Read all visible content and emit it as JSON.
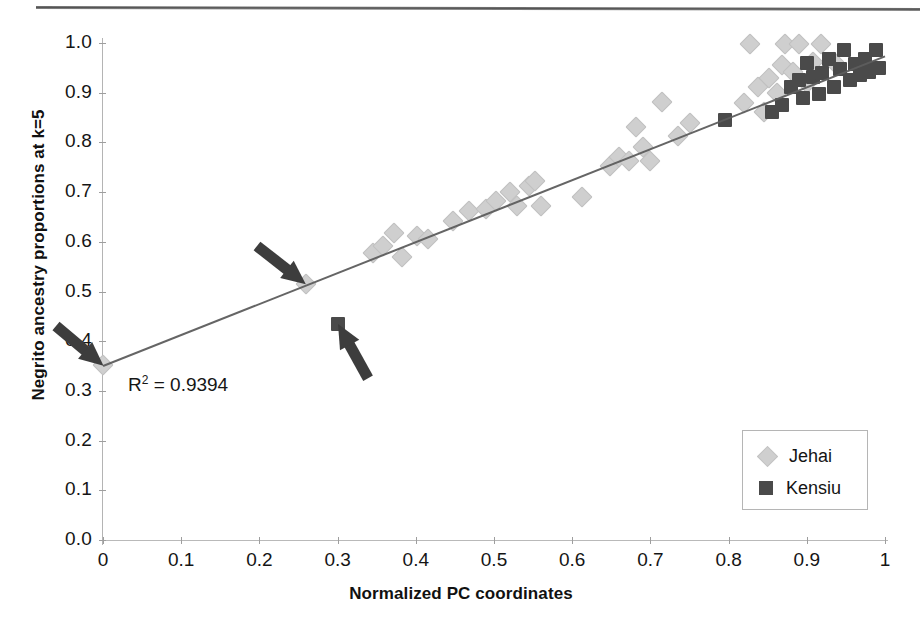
{
  "figure": {
    "annotation_r2_prefix": "R",
    "annotation_r2_sup": "2",
    "annotation_r2_value": " = 0.9394",
    "r2_full": "R2 = 0.9394"
  },
  "legend": {
    "position": "bottom-right",
    "items": [
      {
        "label": "Jehai",
        "marker": "diamond",
        "color": "#cfcfcf"
      },
      {
        "label": "Kensiu",
        "marker": "square",
        "color": "#4a4a4a"
      }
    ]
  },
  "axes": {
    "x_title": "Normalized PC coordinates",
    "y_title": "Negrito ancestry proportions at k=5",
    "x_ticks": [
      "0",
      "0.1",
      "0.2",
      "0.3",
      "0.4",
      "0.5",
      "0.6",
      "0.7",
      "0.8",
      "0.9",
      "1"
    ],
    "y_ticks": [
      "0.0",
      "0.1",
      "0.2",
      "0.3",
      "0.4",
      "0.5",
      "0.6",
      "0.7",
      "0.8",
      "0.9",
      "1.0"
    ]
  },
  "annotations": [
    {
      "name": "arrow-to-origin-point",
      "target_x": 0.0,
      "target_y": 0.35,
      "angle_deg": 40
    },
    {
      "name": "arrow-to-jehai-outlier",
      "target_x": 0.26,
      "target_y": 0.515,
      "angle_deg": 38
    },
    {
      "name": "arrow-to-kensiu-outlier",
      "target_x": 0.3,
      "target_y": 0.435,
      "angle_deg": -119
    }
  ],
  "chart_data": {
    "type": "scatter",
    "title": "",
    "xlabel": "Normalized PC coordinates",
    "ylabel": "Negrito ancestry proportions at k=5",
    "xlim": [
      0,
      1
    ],
    "ylim": [
      0,
      1
    ],
    "xticks": [
      0,
      0.1,
      0.2,
      0.3,
      0.4,
      0.5,
      0.6,
      0.7,
      0.8,
      0.9,
      1
    ],
    "yticks": [
      0.0,
      0.1,
      0.2,
      0.3,
      0.4,
      0.5,
      0.6,
      0.7,
      0.8,
      0.9,
      1.0
    ],
    "grid": false,
    "legend_position": "lower right",
    "annotations": [
      {
        "text": "R2 = 0.9394",
        "x": 0.04,
        "y": 0.335
      }
    ],
    "trendline": {
      "type": "linear",
      "r_squared": 0.9394,
      "x_from": 0.0,
      "y_from": 0.352,
      "x_to": 1.0,
      "y_to": 0.975
    },
    "series": [
      {
        "name": "Jehai",
        "marker": "diamond",
        "color": "#cfcfcf",
        "points": [
          [
            0.0,
            0.352
          ],
          [
            0.26,
            0.515
          ],
          [
            0.345,
            0.578
          ],
          [
            0.358,
            0.592
          ],
          [
            0.372,
            0.618
          ],
          [
            0.382,
            0.57
          ],
          [
            0.402,
            0.612
          ],
          [
            0.415,
            0.605
          ],
          [
            0.447,
            0.642
          ],
          [
            0.468,
            0.662
          ],
          [
            0.49,
            0.665
          ],
          [
            0.502,
            0.683
          ],
          [
            0.52,
            0.7
          ],
          [
            0.53,
            0.672
          ],
          [
            0.545,
            0.712
          ],
          [
            0.552,
            0.722
          ],
          [
            0.56,
            0.672
          ],
          [
            0.612,
            0.69
          ],
          [
            0.648,
            0.752
          ],
          [
            0.66,
            0.77
          ],
          [
            0.672,
            0.762
          ],
          [
            0.682,
            0.83
          ],
          [
            0.69,
            0.79
          ],
          [
            0.7,
            0.762
          ],
          [
            0.715,
            0.882
          ],
          [
            0.735,
            0.812
          ],
          [
            0.75,
            0.84
          ],
          [
            0.82,
            0.88
          ],
          [
            0.828,
            0.998
          ],
          [
            0.838,
            0.912
          ],
          [
            0.845,
            0.862
          ],
          [
            0.852,
            0.93
          ],
          [
            0.862,
            0.9
          ],
          [
            0.868,
            0.955
          ],
          [
            0.872,
            0.998
          ],
          [
            0.882,
            0.942
          ],
          [
            0.89,
            0.998
          ],
          [
            0.9,
            0.92
          ],
          [
            0.908,
            0.962
          ],
          [
            0.918,
            0.998
          ],
          [
            0.935,
            0.962
          ]
        ]
      },
      {
        "name": "Kensiu",
        "marker": "square",
        "color": "#4a4a4a",
        "points": [
          [
            0.3,
            0.435
          ],
          [
            0.795,
            0.845
          ],
          [
            0.855,
            0.862
          ],
          [
            0.868,
            0.875
          ],
          [
            0.88,
            0.912
          ],
          [
            0.89,
            0.925
          ],
          [
            0.895,
            0.89
          ],
          [
            0.9,
            0.96
          ],
          [
            0.908,
            0.932
          ],
          [
            0.915,
            0.898
          ],
          [
            0.92,
            0.94
          ],
          [
            0.928,
            0.968
          ],
          [
            0.935,
            0.912
          ],
          [
            0.942,
            0.948
          ],
          [
            0.948,
            0.985
          ],
          [
            0.955,
            0.925
          ],
          [
            0.962,
            0.958
          ],
          [
            0.968,
            0.935
          ],
          [
            0.975,
            0.968
          ],
          [
            0.98,
            0.942
          ],
          [
            0.988,
            0.985
          ],
          [
            0.992,
            0.95
          ]
        ]
      }
    ]
  }
}
